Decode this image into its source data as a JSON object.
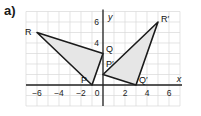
{
  "part_label": "a)",
  "axes": {
    "x_label": "x",
    "y_label": "y",
    "x_ticks": [
      "−6",
      "−4",
      "−2",
      "0",
      "2",
      "4",
      "6"
    ],
    "x_tick_values": [
      -6,
      -4,
      -2,
      0,
      2,
      4,
      6
    ],
    "y_ticks": [
      "4",
      "6"
    ],
    "y_tick_values": [
      4,
      6
    ],
    "x_range": [
      -7,
      7
    ],
    "y_range": [
      -2,
      7
    ]
  },
  "shapes": [
    {
      "name": "PQR",
      "vertices": [
        {
          "label": "P",
          "x": -1,
          "y": 0
        },
        {
          "label": "Q",
          "x": 0,
          "y": 3
        },
        {
          "label": "R",
          "x": -6,
          "y": 5
        }
      ]
    },
    {
      "name": "P'Q'R'",
      "vertices": [
        {
          "label": "P′",
          "x": 0,
          "y": 1
        },
        {
          "label": "Q′",
          "x": 3,
          "y": 0
        },
        {
          "label": "R′",
          "x": 5,
          "y": 6
        }
      ]
    }
  ],
  "colors": {
    "grid": "#d8d8d8",
    "axis": "#222222",
    "shape_fill": "#e6e6e6",
    "shape_stroke": "#1a1a1a"
  }
}
